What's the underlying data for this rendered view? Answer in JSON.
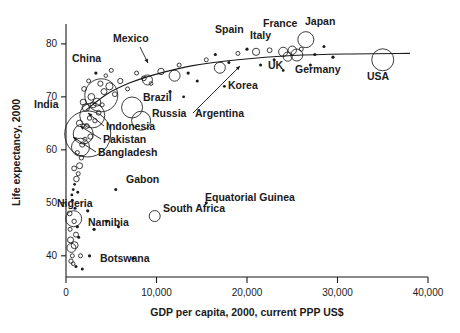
{
  "chart_data": {
    "type": "scatter",
    "title": "",
    "xlabel": "GDP per capita, 2000, current PPP US$",
    "ylabel": "Life expectancy, 2000",
    "xlim": [
      0,
      40000
    ],
    "ylim": [
      36,
      83
    ],
    "grid": false,
    "legend": "none",
    "note": "Bubble scatter; bubble area proportional to population. Open circles, plus a fitted logarithmic trend curve.",
    "xticks": [
      0,
      10000,
      20000,
      30000,
      40000
    ],
    "xticklabels": [
      "0",
      "10,000",
      "20,000",
      "30,000",
      "40,000"
    ],
    "yticks": [
      40,
      50,
      60,
      70,
      80
    ],
    "yticklabels": [
      "40",
      "50",
      "60",
      "70",
      "80"
    ],
    "labeled_points": [
      {
        "name": "China",
        "gdp": 3900,
        "life": 70.3,
        "r": 16.5,
        "label_x": 72,
        "label_y": 62,
        "leader": null
      },
      {
        "name": "Mexico",
        "gdp": 9000,
        "life": 73.2,
        "r": 5.0,
        "label_x": 113,
        "label_y": 42,
        "leader": [
          [
            140,
            47
          ],
          [
            148,
            63
          ]
        ]
      },
      {
        "name": "Spain",
        "gdp": 21000,
        "life": 78.5,
        "r": 3.6,
        "label_x": 215,
        "label_y": 33,
        "leader": null
      },
      {
        "name": "France",
        "gdp": 25000,
        "life": 78.8,
        "r": 4.2,
        "label_x": 263,
        "label_y": 27,
        "leader": null
      },
      {
        "name": "Japan",
        "gdp": 26500,
        "life": 80.8,
        "r": 8.0,
        "label_x": 305,
        "label_y": 25,
        "leader": null
      },
      {
        "name": "Italy",
        "gdp": 24000,
        "life": 78.5,
        "r": 4.6,
        "label_x": 250,
        "label_y": 39,
        "leader": null
      },
      {
        "name": "UK",
        "gdp": 24500,
        "life": 77.6,
        "r": 4.6,
        "label_x": 268,
        "label_y": 69,
        "leader": null
      },
      {
        "name": "Germany",
        "gdp": 25500,
        "life": 77.9,
        "r": 6.0,
        "label_x": 295,
        "label_y": 73,
        "leader": null
      },
      {
        "name": "USA",
        "gdp": 35000,
        "life": 77.0,
        "r": 11.0,
        "label_x": 367,
        "label_y": 80,
        "leader": null
      },
      {
        "name": "Korea",
        "gdp": 17000,
        "life": 75.5,
        "r": 5.5,
        "label_x": 228,
        "label_y": 89,
        "leader": null
      },
      {
        "name": "Brazil",
        "gdp": 7300,
        "life": 68.0,
        "r": 10.5,
        "label_x": 143,
        "label_y": 101,
        "leader": null
      },
      {
        "name": "Argentina",
        "gdp": 12000,
        "life": 74.0,
        "r": 5.5,
        "label_x": 195,
        "label_y": 117,
        "leader": [
          [
            193,
            113
          ],
          [
            240,
            66
          ]
        ]
      },
      {
        "name": "Russia",
        "gdp": 8300,
        "life": 65.5,
        "r": 9.5,
        "label_x": 152,
        "label_y": 117,
        "leader": null
      },
      {
        "name": "India",
        "gdp": 2400,
        "life": 63.0,
        "r": 23.0,
        "label_x": 34,
        "label_y": 108,
        "leader": null
      },
      {
        "name": "Indonesia",
        "gdp": 2900,
        "life": 66.5,
        "r": 12.5,
        "label_x": 106,
        "label_y": 130,
        "leader": [
          [
            104,
            126
          ],
          [
            88,
            113
          ]
        ]
      },
      {
        "name": "Pakistan",
        "gdp": 1900,
        "life": 63.0,
        "r": 10.0,
        "label_x": 103,
        "label_y": 143,
        "leader": [
          [
            101,
            139
          ],
          [
            80,
            126
          ]
        ]
      },
      {
        "name": "Bangladesh",
        "gdp": 1600,
        "life": 60.5,
        "r": 9.0,
        "label_x": 98,
        "label_y": 156,
        "leader": [
          [
            96,
            152
          ],
          [
            73,
            137
          ]
        ]
      },
      {
        "name": "Gabon",
        "gdp": 5500,
        "life": 52.5,
        "r": 1.5,
        "label_x": 126,
        "label_y": 183,
        "leader": null
      },
      {
        "name": "Equatorial Guinea",
        "gdp": 15500,
        "life": 50.0,
        "r": 1.5,
        "label_x": 205,
        "label_y": 201,
        "leader": null
      },
      {
        "name": "South Africa",
        "gdp": 9800,
        "life": 47.5,
        "r": 5.5,
        "label_x": 163,
        "label_y": 212,
        "leader": null
      },
      {
        "name": "Nigeria",
        "gdp": 850,
        "life": 47.0,
        "r": 8.0,
        "label_x": 57,
        "label_y": 207,
        "leader": null
      },
      {
        "name": "Namibia",
        "gdp": 5800,
        "life": 45.5,
        "r": 1.5,
        "label_x": 88,
        "label_y": 226,
        "leader": null
      },
      {
        "name": "Botswana",
        "gdp": 7400,
        "life": 39.5,
        "r": 1.6,
        "label_x": 100,
        "label_y": 262,
        "leader": null
      }
    ],
    "unlabeled_points": [
      {
        "gdp": 500,
        "life": 43.0,
        "r": 3.0
      },
      {
        "gdp": 600,
        "life": 41.5,
        "r": 4.5
      },
      {
        "gdp": 450,
        "life": 45.0,
        "r": 2.0
      },
      {
        "gdp": 700,
        "life": 40.0,
        "r": 2.0
      },
      {
        "gdp": 800,
        "life": 38.5,
        "r": 1.8
      },
      {
        "gdp": 550,
        "life": 39.0,
        "r": 2.2
      },
      {
        "gdp": 950,
        "life": 42.0,
        "r": 3.5
      },
      {
        "gdp": 1100,
        "life": 44.0,
        "r": 2.5
      },
      {
        "gdp": 1250,
        "life": 45.5,
        "r": 1.6
      },
      {
        "gdp": 900,
        "life": 46.5,
        "r": 2.2
      },
      {
        "gdp": 1400,
        "life": 43.5,
        "r": 1.5
      },
      {
        "gdp": 1600,
        "life": 40.0,
        "r": 2.0
      },
      {
        "gdp": 400,
        "life": 48.0,
        "r": 2.4
      },
      {
        "gdp": 1000,
        "life": 49.0,
        "r": 1.5
      },
      {
        "gdp": 700,
        "life": 50.5,
        "r": 1.5
      },
      {
        "gdp": 650,
        "life": 51.5,
        "r": 1.4
      },
      {
        "gdp": 800,
        "life": 52.5,
        "r": 1.4
      },
      {
        "gdp": 950,
        "life": 53.5,
        "r": 1.4
      },
      {
        "gdp": 1150,
        "life": 54.5,
        "r": 2.8
      },
      {
        "gdp": 1350,
        "life": 55.5,
        "r": 2.0
      },
      {
        "gdp": 1500,
        "life": 57.0,
        "r": 3.0
      },
      {
        "gdp": 1700,
        "life": 58.5,
        "r": 2.2
      },
      {
        "gdp": 900,
        "life": 56.5,
        "r": 2.4
      },
      {
        "gdp": 1250,
        "life": 59.5,
        "r": 2.0
      },
      {
        "gdp": 1800,
        "life": 61.0,
        "r": 2.6
      },
      {
        "gdp": 2100,
        "life": 62.0,
        "r": 2.0
      },
      {
        "gdp": 2300,
        "life": 64.5,
        "r": 2.4
      },
      {
        "gdp": 1500,
        "life": 65.0,
        "r": 3.2
      },
      {
        "gdp": 2600,
        "life": 66.0,
        "r": 2.2
      },
      {
        "gdp": 3000,
        "life": 68.5,
        "r": 3.0
      },
      {
        "gdp": 3400,
        "life": 69.0,
        "r": 4.0
      },
      {
        "gdp": 2800,
        "life": 70.0,
        "r": 3.4
      },
      {
        "gdp": 2200,
        "life": 68.0,
        "r": 3.8
      },
      {
        "gdp": 4200,
        "life": 71.0,
        "r": 3.0
      },
      {
        "gdp": 4800,
        "life": 72.0,
        "r": 3.6
      },
      {
        "gdp": 3800,
        "life": 72.5,
        "r": 2.6
      },
      {
        "gdp": 5400,
        "life": 70.5,
        "r": 2.4
      },
      {
        "gdp": 6000,
        "life": 73.0,
        "r": 2.6
      },
      {
        "gdp": 6800,
        "life": 71.5,
        "r": 2.0
      },
      {
        "gdp": 5000,
        "life": 75.0,
        "r": 2.0
      },
      {
        "gdp": 4400,
        "life": 74.0,
        "r": 1.8
      },
      {
        "gdp": 7800,
        "life": 74.5,
        "r": 2.0
      },
      {
        "gdp": 8600,
        "life": 73.5,
        "r": 2.4
      },
      {
        "gdp": 9400,
        "life": 72.5,
        "r": 1.8
      },
      {
        "gdp": 10500,
        "life": 74.8,
        "r": 3.2
      },
      {
        "gdp": 11500,
        "life": 71.0,
        "r": 1.6
      },
      {
        "gdp": 12500,
        "life": 76.0,
        "r": 2.0
      },
      {
        "gdp": 13500,
        "life": 74.5,
        "r": 1.6
      },
      {
        "gdp": 14500,
        "life": 73.0,
        "r": 1.5
      },
      {
        "gdp": 15500,
        "life": 77.0,
        "r": 2.0
      },
      {
        "gdp": 16500,
        "life": 78.0,
        "r": 1.6
      },
      {
        "gdp": 18000,
        "life": 76.5,
        "r": 1.5
      },
      {
        "gdp": 19000,
        "life": 78.2,
        "r": 2.0
      },
      {
        "gdp": 20000,
        "life": 79.0,
        "r": 1.6
      },
      {
        "gdp": 21500,
        "life": 76.0,
        "r": 1.5
      },
      {
        "gdp": 22500,
        "life": 78.8,
        "r": 2.4
      },
      {
        "gdp": 23000,
        "life": 77.0,
        "r": 1.5
      },
      {
        "gdp": 26000,
        "life": 79.0,
        "r": 2.0
      },
      {
        "gdp": 27500,
        "life": 78.0,
        "r": 1.6
      },
      {
        "gdp": 28500,
        "life": 79.5,
        "r": 1.5
      },
      {
        "gdp": 29500,
        "life": 77.5,
        "r": 1.6
      },
      {
        "gdp": 27000,
        "life": 76.0,
        "r": 1.5
      },
      {
        "gdp": 24000,
        "life": 75.0,
        "r": 1.4
      },
      {
        "gdp": 17500,
        "life": 72.0,
        "r": 1.4
      },
      {
        "gdp": 13000,
        "life": 70.0,
        "r": 1.4
      },
      {
        "gdp": 3300,
        "life": 74.5,
        "r": 1.6
      },
      {
        "gdp": 2500,
        "life": 73.0,
        "r": 2.0
      },
      {
        "gdp": 2000,
        "life": 71.5,
        "r": 2.4
      },
      {
        "gdp": 1900,
        "life": 69.0,
        "r": 3.0
      },
      {
        "gdp": 2700,
        "life": 62.5,
        "r": 2.6
      },
      {
        "gdp": 3200,
        "life": 65.5,
        "r": 2.2
      },
      {
        "gdp": 3600,
        "life": 67.0,
        "r": 2.4
      },
      {
        "gdp": 4000,
        "life": 68.5,
        "r": 2.0
      },
      {
        "gdp": 1300,
        "life": 52.0,
        "r": 1.4
      },
      {
        "gdp": 2400,
        "life": 48.5,
        "r": 1.6
      },
      {
        "gdp": 3100,
        "life": 45.0,
        "r": 1.6
      },
      {
        "gdp": 4500,
        "life": 46.5,
        "r": 1.5
      },
      {
        "gdp": 2600,
        "life": 40.0,
        "r": 1.6
      },
      {
        "gdp": 1800,
        "life": 37.5,
        "r": 1.5
      },
      {
        "gdp": 1100,
        "life": 38.0,
        "r": 1.5
      }
    ],
    "trendline": {
      "description": "fitted concave curve rising steeply at low GDP then flattening near 78 years",
      "points": [
        {
          "gdp": 2200,
          "life": 67.5
        },
        {
          "gdp": 4500,
          "life": 70.5
        },
        {
          "gdp": 7000,
          "life": 72.6
        },
        {
          "gdp": 10000,
          "life": 74.3
        },
        {
          "gdp": 14000,
          "life": 75.9
        },
        {
          "gdp": 19000,
          "life": 77.0
        },
        {
          "gdp": 25000,
          "life": 77.8
        },
        {
          "gdp": 31000,
          "life": 78.1
        },
        {
          "gdp": 38000,
          "life": 78.2
        }
      ]
    }
  }
}
